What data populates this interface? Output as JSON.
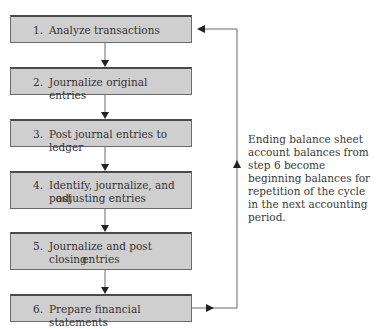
{
  "title_fragment": "",
  "steps": [
    {
      "number": "1.",
      "text": "Analyze transactions",
      "text2": ""
    },
    {
      "number": "2.",
      "text": "Journalize original entries",
      "text2": ""
    },
    {
      "number": "3.",
      "text": "Post journal entries to ledger",
      "text2": ""
    },
    {
      "number": "4.",
      "text": "Identify, journalize, and post",
      "text2": "adjusting entries"
    },
    {
      "number": "5.",
      "text": "Journalize and post closing",
      "text2": "entries"
    },
    {
      "number": "6.",
      "text": "Prepare financial statements",
      "text2": ""
    }
  ],
  "note": "Ending balance sheet account balances from step 6 become beginning balances for repetition of the cycle in the next accounting period.",
  "colors": {
    "box_fill": "#cfcfcf",
    "line": "#555555",
    "text": "#3a3a3a"
  }
}
